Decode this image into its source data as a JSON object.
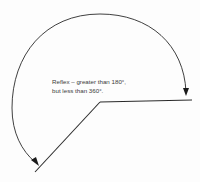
{
  "diagram": {
    "type": "angle",
    "angle_kind": "reflex",
    "label_lines": [
      "Reflex – greater than 180°,",
      "but less than 360°."
    ],
    "colors": {
      "stroke": "#2a2a2a",
      "text": "#3a3a3a",
      "background": "#fdfdfd"
    },
    "elements": {
      "vertex": "vertex-point",
      "rays": [
        "horizontal-ray",
        "diagonal-ray"
      ],
      "arc": "reflex-arc",
      "arrowheads": [
        "arrowhead-right",
        "arrowhead-left"
      ]
    }
  }
}
